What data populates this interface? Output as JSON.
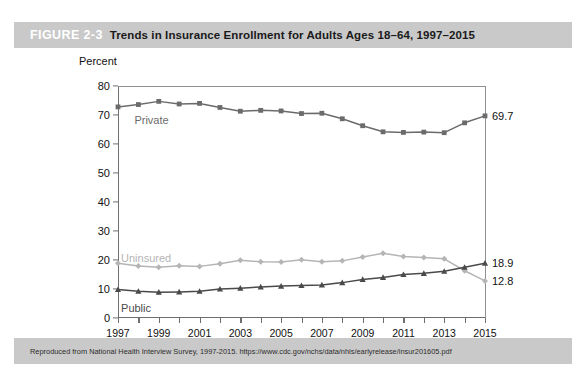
{
  "figure": {
    "number": "FIGURE 2-3",
    "title": "Trends in Insurance Enrollment for Adults Ages 18–64, 1997–2015",
    "source_note": "Reproduced from National Health Interview Survey, 1997-2015. https://www.cdc.gov/nchs/data/nhis/earlyrelease/insur201605.pdf",
    "header_bg": "#c9c9c9",
    "number_color": "#ffffff",
    "title_color": "#1a1a1a"
  },
  "chart_data": {
    "type": "line",
    "title": "Trends in Insurance Enrollment for Adults Ages 18–64, 1997–2015",
    "xlabel": "",
    "ylabel": "Percent",
    "ylim": [
      0,
      80
    ],
    "xlim": [
      1997,
      2015
    ],
    "ytick_values": [
      0,
      10,
      20,
      30,
      40,
      50,
      60,
      70,
      80
    ],
    "ytick_labels": [
      "0",
      "10",
      "20",
      "30",
      "40",
      "50",
      "60",
      "70",
      "80"
    ],
    "xtick_values": [
      1997,
      1999,
      2001,
      2003,
      2005,
      2007,
      2009,
      2011,
      2013,
      2015
    ],
    "xtick_labels": [
      "1997",
      "1999",
      "2001",
      "2003",
      "2005",
      "2007",
      "2009",
      "2011",
      "2013",
      "2015"
    ],
    "x": [
      1997,
      1998,
      1999,
      2000,
      2001,
      2002,
      2003,
      2004,
      2005,
      2006,
      2007,
      2008,
      2009,
      2010,
      2011,
      2012,
      2013,
      2014,
      2015
    ],
    "grid": false,
    "legend_position": "inline-labels",
    "series": [
      {
        "name": "Private",
        "label": "Private",
        "color": "#6b6b6b",
        "marker": "square",
        "values": [
          72.8,
          73.6,
          74.7,
          73.8,
          74.0,
          72.6,
          71.3,
          71.6,
          71.4,
          70.5,
          70.6,
          68.7,
          66.3,
          64.2,
          64.0,
          64.1,
          63.9,
          67.3,
          69.7
        ],
        "end_value_label": "69.7"
      },
      {
        "name": "Uninsured",
        "label": "Uninsured",
        "color": "#b5b5b5",
        "marker": "diamond",
        "values": [
          18.9,
          17.9,
          17.5,
          18.0,
          17.8,
          18.7,
          19.9,
          19.4,
          19.3,
          20.1,
          19.4,
          19.7,
          21.0,
          22.3,
          21.2,
          20.9,
          20.4,
          16.3,
          12.8
        ],
        "end_value_label": "12.8"
      },
      {
        "name": "Public",
        "label": "Public",
        "color": "#4a4a4a",
        "marker": "triangle",
        "values": [
          9.8,
          9.2,
          8.9,
          9.0,
          9.2,
          10.0,
          10.3,
          10.7,
          11.0,
          11.2,
          11.4,
          12.2,
          13.3,
          14.0,
          15.0,
          15.4,
          16.1,
          17.5,
          18.9
        ],
        "end_value_label": "18.9"
      }
    ],
    "annotations": [
      {
        "text": "Private",
        "series": "Private"
      },
      {
        "text": "Uninsured",
        "series": "Uninsured"
      },
      {
        "text": "Public",
        "series": "Public"
      }
    ]
  }
}
